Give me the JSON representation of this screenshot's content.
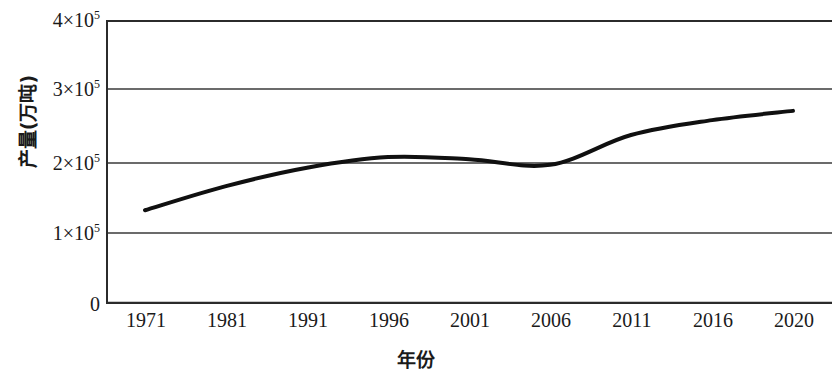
{
  "chart_data": {
    "type": "line",
    "title": "",
    "xlabel": "年份",
    "ylabel": "产量(万吨)",
    "x": [
      1971,
      1981,
      1991,
      1996,
      2001,
      2006,
      2011,
      2016,
      2020
    ],
    "xtick_labels": [
      "1971",
      "1981",
      "1991",
      "1996",
      "2001",
      "2006",
      "2011",
      "2016",
      "2020"
    ],
    "values": [
      132000,
      166000,
      192000,
      207000,
      204000,
      196000,
      238000,
      259000,
      272000
    ],
    "series": [
      {
        "name": "产量",
        "values": [
          132000,
          166000,
          192000,
          207000,
          204000,
          196000,
          238000,
          259000,
          272000
        ]
      }
    ],
    "ylim": [
      0,
      400000
    ],
    "ytick_values": [
      0,
      100000,
      200000,
      300000,
      400000
    ],
    "ytick_labels": [
      "0",
      "1×10",
      "2×10",
      "3×10",
      "4×10"
    ],
    "ytick_exponents": [
      "",
      "5",
      "5",
      "5",
      "5"
    ],
    "ytick_display": [
      "4×10⁵",
      "3×10⁵",
      "2×10⁵",
      "1×10⁵",
      "0"
    ],
    "grid": true,
    "grid_axis": "y",
    "legend": null,
    "legend_position": "none",
    "line_color": "#101010",
    "line_width": 4,
    "axis_color": "#2b2b2b",
    "grid_color": "#3a3a3a",
    "background": "#ffffff"
  },
  "axes": {
    "y": {
      "title": "产量(万吨)",
      "ticks": [
        {
          "label_main": "4×10",
          "label_sup": "5",
          "value": 400000
        },
        {
          "label_main": "3×10",
          "label_sup": "5",
          "value": 300000
        },
        {
          "label_main": "2×10",
          "label_sup": "5",
          "value": 200000
        },
        {
          "label_main": "1×10",
          "label_sup": "5",
          "value": 100000
        },
        {
          "label_main": "0",
          "label_sup": "",
          "value": 0
        }
      ]
    },
    "x": {
      "title": "年份",
      "ticks": [
        {
          "label": "1971"
        },
        {
          "label": "1981"
        },
        {
          "label": "1991"
        },
        {
          "label": "1996"
        },
        {
          "label": "2001"
        },
        {
          "label": "2006"
        },
        {
          "label": "2011"
        },
        {
          "label": "2016"
        },
        {
          "label": "2020"
        }
      ]
    }
  }
}
